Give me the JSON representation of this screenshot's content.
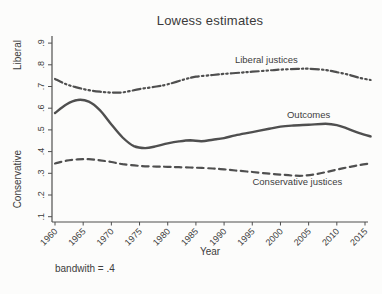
{
  "chart_data": {
    "type": "line",
    "title": "Lowess estimates",
    "xlabel": "Year",
    "ylabel_top": "Liberal",
    "ylabel_bottom": "Conservative",
    "note": "bandwith = .4",
    "grid": false,
    "legend": "inline-labels",
    "line_color": "#4f4f4f",
    "tick_text_color": "#3d3d3d",
    "xlim": [
      1960,
      2016
    ],
    "ylim": [
      0.1,
      0.9
    ],
    "xticks": {
      "values": [
        1960,
        1965,
        1970,
        1975,
        1980,
        1985,
        1990,
        1995,
        2000,
        2005,
        2010,
        2015
      ],
      "labels": [
        "1960",
        "1965",
        "1970",
        "1975",
        "1980",
        "1985",
        "1990",
        "1995",
        "2000",
        "2005",
        "2010",
        "2015"
      ]
    },
    "yticks": {
      "values": [
        0.1,
        0.2,
        0.3,
        0.4,
        0.5,
        0.6,
        0.7,
        0.8,
        0.9
      ],
      "labels": [
        ".1",
        ".2",
        ".3",
        ".4",
        ".5",
        ".6",
        ".7",
        ".8",
        ".9"
      ]
    },
    "series": [
      {
        "name": "Liberal justices",
        "style": "dash-dot-dot",
        "label_pos": {
          "x": 1997.5,
          "y": 0.81
        },
        "x": [
          1960,
          1962,
          1964,
          1966,
          1968,
          1970,
          1972,
          1975,
          1978,
          1980,
          1983,
          1985,
          1988,
          1990,
          1993,
          1995,
          1998,
          2000,
          2003,
          2005,
          2008,
          2010,
          2012,
          2014,
          2016
        ],
        "y": [
          0.735,
          0.71,
          0.695,
          0.683,
          0.676,
          0.672,
          0.673,
          0.688,
          0.7,
          0.71,
          0.733,
          0.745,
          0.753,
          0.758,
          0.764,
          0.768,
          0.774,
          0.778,
          0.781,
          0.782,
          0.776,
          0.766,
          0.755,
          0.74,
          0.73
        ]
      },
      {
        "name": "Outcomes",
        "style": "solid",
        "label_pos": {
          "x": 2005,
          "y": 0.555
        },
        "x": [
          1960,
          1962,
          1964,
          1966,
          1968,
          1970,
          1972,
          1974,
          1976,
          1978,
          1980,
          1982,
          1984,
          1986,
          1988,
          1990,
          1992,
          1995,
          1998,
          2000,
          2002,
          2005,
          2008,
          2010,
          2012,
          2014,
          2016
        ],
        "y": [
          0.578,
          0.617,
          0.638,
          0.63,
          0.59,
          0.525,
          0.465,
          0.425,
          0.416,
          0.425,
          0.438,
          0.447,
          0.452,
          0.448,
          0.455,
          0.462,
          0.475,
          0.49,
          0.505,
          0.515,
          0.52,
          0.524,
          0.528,
          0.522,
          0.505,
          0.485,
          0.47
        ]
      },
      {
        "name": "Conservative justices",
        "style": "dashed",
        "label_pos": {
          "x": 2003,
          "y": 0.246
        },
        "x": [
          1960,
          1962,
          1964,
          1966,
          1968,
          1970,
          1972,
          1975,
          1978,
          1980,
          1982,
          1985,
          1988,
          1990,
          1992,
          1995,
          1998,
          2000,
          2002,
          2004,
          2006,
          2008,
          2010,
          2012,
          2014,
          2016
        ],
        "y": [
          0.345,
          0.358,
          0.364,
          0.365,
          0.36,
          0.352,
          0.342,
          0.334,
          0.331,
          0.33,
          0.328,
          0.326,
          0.322,
          0.318,
          0.313,
          0.306,
          0.298,
          0.294,
          0.29,
          0.289,
          0.295,
          0.305,
          0.317,
          0.328,
          0.338,
          0.346
        ]
      }
    ]
  }
}
